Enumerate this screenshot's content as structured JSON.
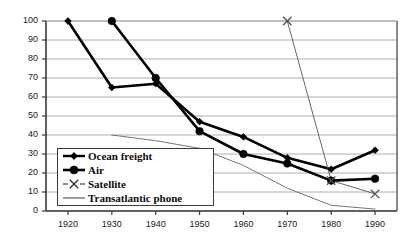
{
  "chart_data": {
    "type": "line",
    "title": "",
    "subtitle": "",
    "xlabel": "",
    "ylabel": "",
    "x": [
      1920,
      1930,
      1940,
      1950,
      1960,
      1970,
      1980,
      1990
    ],
    "xlim": [
      1915,
      1995
    ],
    "ylim": [
      0,
      100
    ],
    "ytick_labels": [
      "0",
      "10",
      "20",
      "30",
      "40",
      "50",
      "60",
      "70",
      "80",
      "90",
      "100"
    ],
    "yticks": [
      0,
      10,
      20,
      30,
      40,
      50,
      60,
      70,
      80,
      90,
      100
    ],
    "xtick_labels": [
      "1920",
      "1930",
      "1940",
      "1950",
      "1960",
      "1970",
      "1980",
      "1990"
    ],
    "grid": "horizontal",
    "legend_position": "lower-left-inside",
    "series": [
      {
        "name": "Ocean freight",
        "marker": "filled-diamond",
        "color": "#000000",
        "x": [
          1920,
          1930,
          1940,
          1950,
          1960,
          1970,
          1980,
          1990
        ],
        "values": [
          100,
          65,
          67,
          47,
          39,
          28,
          22,
          32
        ]
      },
      {
        "name": "Air",
        "marker": "filled-circle",
        "color": "#000000",
        "x": [
          1930,
          1940,
          1950,
          1960,
          1970,
          1980,
          1990
        ],
        "values": [
          100,
          70,
          42,
          30,
          25,
          16,
          17
        ]
      },
      {
        "name": "Satellite",
        "marker": "x-cross",
        "color": "#555555",
        "x": [
          1970,
          1980,
          1990
        ],
        "values": [
          100,
          16,
          9
        ]
      },
      {
        "name": "Transatlantic phone",
        "marker": "none",
        "color": "#666666",
        "x": [
          1930,
          1940,
          1950,
          1960,
          1970,
          1980,
          1990
        ],
        "values": [
          40,
          37,
          33,
          24,
          12,
          3,
          1
        ]
      }
    ]
  },
  "legend": {
    "items": [
      {
        "label": "Ocean freight",
        "marker": "filled-diamond"
      },
      {
        "label": "Air",
        "marker": "filled-circle"
      },
      {
        "label": "Satellite",
        "marker": "x-cross"
      },
      {
        "label": "Transatlantic phone",
        "marker": "plain-line"
      }
    ]
  },
  "axes": {
    "y_labels": [
      "100",
      "90",
      "80",
      "70",
      "60",
      "50",
      "40",
      "30",
      "20",
      "10",
      "0"
    ],
    "x_labels": [
      "1920",
      "1930",
      "1940",
      "1950",
      "1960",
      "1970",
      "1980",
      "1990"
    ]
  },
  "colors": {
    "ink": "#000000",
    "grid": "#9a9a9a",
    "axis": "#3a3a3a",
    "thin_series": "#666666",
    "background": "#ffffff"
  }
}
